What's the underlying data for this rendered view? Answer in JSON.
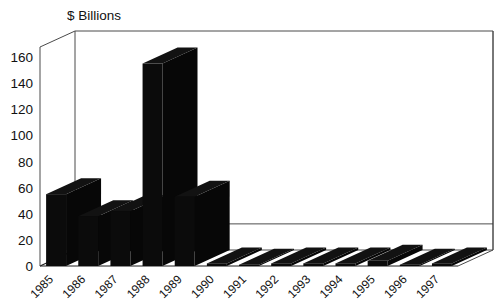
{
  "chart_data": {
    "type": "bar",
    "title": "$ Billions",
    "xlabel": "",
    "ylabel": "",
    "ylim": [
      0,
      160
    ],
    "ytick_step": 20,
    "grid": false,
    "legend": "none",
    "three_d": true,
    "categories": [
      "1985",
      "1986",
      "1987",
      "1988",
      "1989",
      "1990",
      "1991",
      "1992",
      "1993",
      "1994",
      "1995",
      "1996",
      "1997"
    ],
    "values": [
      55,
      38,
      42,
      155,
      53,
      2,
      1,
      2,
      2,
      2,
      4,
      1,
      2
    ],
    "ytick_labels": [
      "0",
      "20",
      "40",
      "60",
      "80",
      "100",
      "120",
      "140",
      "160"
    ],
    "series": [
      {
        "name": "$ Billions",
        "values": [
          55,
          38,
          42,
          155,
          53,
          2,
          1,
          2,
          2,
          2,
          4,
          1,
          2
        ]
      }
    ],
    "colors": {
      "bar": "#0b0b0b",
      "axis": "#4a4a4a",
      "text": "#111111",
      "background": "#ffffff"
    }
  },
  "axis": {
    "y_title": "$ Billions",
    "ticks": [
      "160",
      "140",
      "120",
      "100",
      "80",
      "60",
      "40",
      "20",
      "0"
    ],
    "categories": [
      "1985",
      "1986",
      "1987",
      "1988",
      "1989",
      "1990",
      "1991",
      "1992",
      "1993",
      "1994",
      "1995",
      "1996",
      "1997"
    ]
  }
}
